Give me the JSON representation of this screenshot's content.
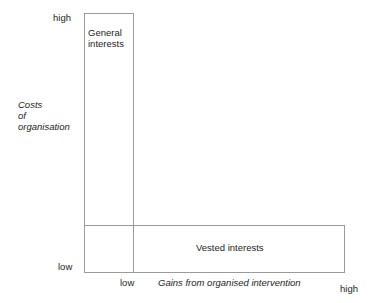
{
  "diagram": {
    "type": "two-by-two-conceptual-matrix",
    "background_color": "#ffffff",
    "line_color": "#9a9a9a",
    "text_color": "#1d1d1d",
    "y_axis": {
      "title": "Costs\nof\norganisation",
      "high_label": "high",
      "low_label": "low"
    },
    "x_axis": {
      "title": "Gains from organised intervention",
      "low_label": "low",
      "high_label": "high"
    },
    "regions": [
      {
        "name": "general-interests",
        "label": "General\ninterests"
      },
      {
        "name": "vested-interests",
        "label": "Vested interests"
      }
    ]
  }
}
